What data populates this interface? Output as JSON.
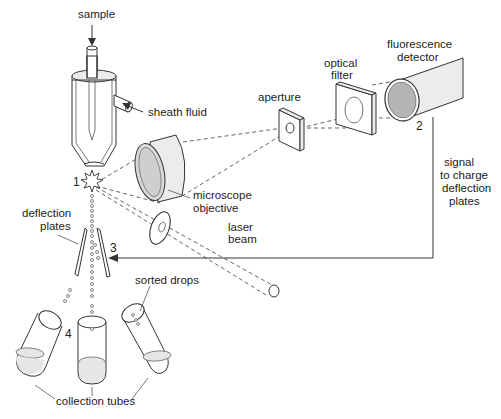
{
  "diagram": {
    "labels": {
      "sample": "sample",
      "sheath_fluid": "sheath fluid",
      "aperture": "aperture",
      "optical_filter_line1": "optical",
      "optical_filter_line2": "filter",
      "fluorescence_detector_line1": "fluorescence",
      "fluorescence_detector_line2": "detector",
      "microscope_objective_line1": "microscope",
      "microscope_objective_line2": "objective",
      "signal_line1": "signal",
      "signal_line2": "to charge",
      "signal_line3": "deflection",
      "signal_line4": "plates",
      "deflection_plates_line1": "deflection",
      "deflection_plates_line2": "plates",
      "laser_beam_line1": "laser",
      "laser_beam_line2": "beam",
      "sorted_drops": "sorted drops",
      "collection_tubes": "collection tubes"
    },
    "step_numbers": {
      "one": "1",
      "two": "2",
      "three": "3",
      "four": "4"
    },
    "colors": {
      "line": "#333333",
      "fill_grey": "#d9d9d9",
      "fill_light": "#ececec",
      "background": "#ffffff"
    }
  }
}
